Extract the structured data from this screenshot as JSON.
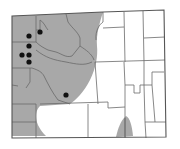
{
  "map": {
    "subject": "Wyoming county distribution map",
    "colors": {
      "background": "#ffffff",
      "range_fill": "#a8a8a8",
      "county_line": "#6a6a6a",
      "state_border": "#555555",
      "record_dot": "#111111"
    },
    "range_regions": [
      {
        "name": "western-range",
        "path": "M12,16 L103,12 C100,22 96,34 97,46 C98,56 96,68 90,80 C84,92 76,100 70,104 L40,106 C34,112 34,124 46,136 L12,136 Z"
      },
      {
        "name": "south-central-range",
        "path": "M116,137 C118,128 121,120 126,116 C130,118 132,126 133,136 Z"
      }
    ],
    "records": [
      {
        "x": 40,
        "y": 32
      },
      {
        "x": 29,
        "y": 36
      },
      {
        "x": 29,
        "y": 46
      },
      {
        "x": 22,
        "y": 55
      },
      {
        "x": 29,
        "y": 55
      },
      {
        "x": 29,
        "y": 62
      },
      {
        "x": 66,
        "y": 95
      }
    ]
  }
}
